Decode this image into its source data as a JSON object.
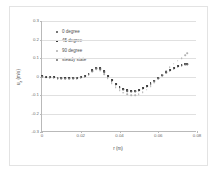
{
  "chart_data": {
    "type": "scatter",
    "title": "",
    "xlabel": "r (m)",
    "ylabel": "u_z (m/s)",
    "xlim": [
      0,
      0.08
    ],
    "ylim": [
      -0.3,
      0.3
    ],
    "xticks": [
      "0",
      "0.02",
      "0.04",
      "0.06",
      "0.08"
    ],
    "xtick_values": [
      0,
      0.02,
      0.04,
      0.06,
      0.08
    ],
    "yticks": [
      "0.3",
      "0.2",
      "0.1",
      "0",
      "-0.1",
      "-0.2",
      "-0.3"
    ],
    "ytick_values": [
      0.3,
      0.2,
      0.1,
      0,
      -0.1,
      -0.2,
      -0.3
    ],
    "grid": true,
    "legend_position": "upper-left",
    "series": [
      {
        "name": "0 degree",
        "color": "#4d4d4d",
        "marker": "dot",
        "x": [
          0.0,
          0.002,
          0.004,
          0.006,
          0.008,
          0.01,
          0.012,
          0.014,
          0.016,
          0.018,
          0.02,
          0.022,
          0.024,
          0.026,
          0.028,
          0.03,
          0.032,
          0.034,
          0.036,
          0.038,
          0.04,
          0.042,
          0.044,
          0.046,
          0.048,
          0.05,
          0.052,
          0.054,
          0.056,
          0.058,
          0.06,
          0.062,
          0.064,
          0.066,
          0.068,
          0.07,
          0.072,
          0.074,
          0.075
        ],
        "values": [
          0.0,
          -0.002,
          -0.004,
          -0.006,
          -0.008,
          -0.009,
          -0.01,
          -0.01,
          -0.009,
          -0.007,
          -0.004,
          0.001,
          0.012,
          0.03,
          0.044,
          0.042,
          0.026,
          0.003,
          -0.021,
          -0.042,
          -0.058,
          -0.069,
          -0.076,
          -0.079,
          -0.078,
          -0.073,
          -0.064,
          -0.052,
          -0.038,
          -0.023,
          -0.008,
          0.007,
          0.021,
          0.034,
          0.045,
          0.054,
          0.061,
          0.066,
          0.068
        ]
      },
      {
        "name": "45 degree",
        "color": "#3a3a3a",
        "marker": "square",
        "x": [
          0.0,
          0.002,
          0.004,
          0.006,
          0.008,
          0.01,
          0.012,
          0.014,
          0.016,
          0.018,
          0.02,
          0.022,
          0.024,
          0.026,
          0.028,
          0.03,
          0.032,
          0.034,
          0.036,
          0.038,
          0.04,
          0.042,
          0.044,
          0.046,
          0.048,
          0.05,
          0.052,
          0.054,
          0.056,
          0.058,
          0.06,
          0.062,
          0.064,
          0.066,
          0.068,
          0.07,
          0.072,
          0.074,
          0.075
        ],
        "values": [
          0.001,
          -0.001,
          -0.003,
          -0.005,
          -0.007,
          -0.008,
          -0.009,
          -0.009,
          -0.008,
          -0.006,
          -0.002,
          0.004,
          0.016,
          0.034,
          0.048,
          0.045,
          0.028,
          0.004,
          -0.02,
          -0.041,
          -0.057,
          -0.068,
          -0.075,
          -0.078,
          -0.077,
          -0.072,
          -0.063,
          -0.051,
          -0.037,
          -0.022,
          -0.007,
          0.008,
          0.022,
          0.035,
          0.046,
          0.055,
          0.062,
          0.067,
          0.069
        ]
      },
      {
        "name": "90 degree",
        "color": "#b0b0b0",
        "marker": "dot",
        "x": [
          0.0,
          0.002,
          0.004,
          0.006,
          0.008,
          0.01,
          0.012,
          0.014,
          0.016,
          0.018,
          0.02,
          0.022,
          0.024,
          0.026,
          0.028,
          0.03,
          0.032,
          0.034,
          0.036,
          0.038,
          0.04,
          0.042,
          0.044,
          0.046,
          0.048,
          0.05,
          0.052,
          0.054,
          0.056,
          0.058,
          0.06,
          0.062,
          0.064,
          0.066,
          0.068,
          0.07,
          0.072,
          0.074,
          0.075
        ],
        "values": [
          0.0,
          -0.002,
          -0.004,
          -0.007,
          -0.009,
          -0.011,
          -0.012,
          -0.012,
          -0.011,
          -0.009,
          -0.005,
          0.0,
          0.01,
          0.026,
          0.038,
          0.032,
          0.014,
          -0.01,
          -0.035,
          -0.057,
          -0.074,
          -0.087,
          -0.095,
          -0.1,
          -0.101,
          -0.096,
          -0.086,
          -0.071,
          -0.053,
          -0.033,
          -0.012,
          0.01,
          0.031,
          0.051,
          0.07,
          0.086,
          0.1,
          0.115,
          0.126
        ]
      },
      {
        "name": "steady state",
        "color": "#6e6e6e",
        "marker": "dot",
        "x": [
          0.0,
          0.002,
          0.004,
          0.006,
          0.008,
          0.01,
          0.012,
          0.014,
          0.016,
          0.018,
          0.02,
          0.022,
          0.024,
          0.026,
          0.028,
          0.03,
          0.032,
          0.034,
          0.036,
          0.038,
          0.04,
          0.042,
          0.044,
          0.046,
          0.048,
          0.05,
          0.052,
          0.054,
          0.056,
          0.058,
          0.06,
          0.062,
          0.064,
          0.066,
          0.068,
          0.07,
          0.072,
          0.074,
          0.075
        ],
        "values": [
          0.0,
          -0.002,
          -0.004,
          -0.006,
          -0.008,
          -0.01,
          -0.011,
          -0.011,
          -0.01,
          -0.008,
          -0.004,
          0.002,
          0.013,
          0.031,
          0.045,
          0.041,
          0.024,
          0.0,
          -0.024,
          -0.045,
          -0.061,
          -0.072,
          -0.079,
          -0.082,
          -0.081,
          -0.076,
          -0.067,
          -0.055,
          -0.041,
          -0.026,
          -0.01,
          0.005,
          0.02,
          0.033,
          0.044,
          0.053,
          0.06,
          0.065,
          0.067
        ]
      }
    ]
  }
}
